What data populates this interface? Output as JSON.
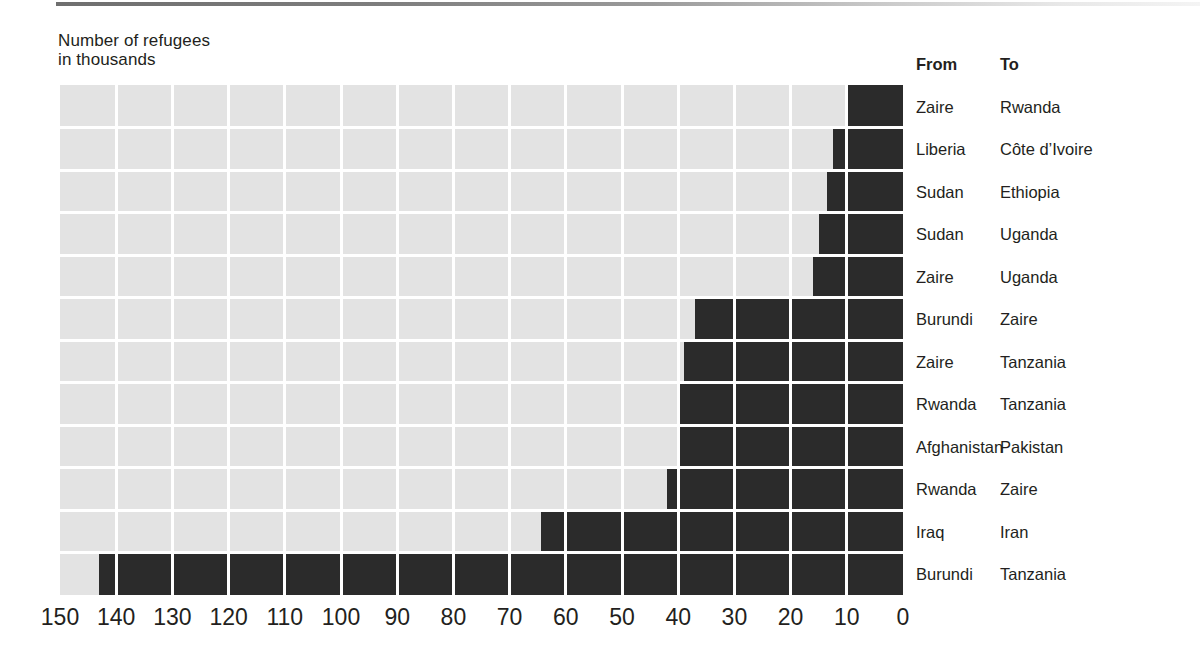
{
  "chart_data": {
    "type": "bar",
    "orientation": "horizontal",
    "title": "Number of refugees\nin thousands",
    "title_lines": [
      "Number of refugees",
      "in thousands"
    ],
    "xlabel": "",
    "ylabel": "",
    "xlim": [
      150,
      0
    ],
    "x_axis_reversed": true,
    "xticks": [
      150,
      140,
      130,
      120,
      110,
      100,
      90,
      80,
      70,
      60,
      50,
      40,
      30,
      20,
      10,
      0
    ],
    "xtick_labels": [
      "150",
      "140",
      "130",
      "120",
      "110",
      "100",
      "90",
      "80",
      "70",
      "60",
      "50",
      "40",
      "30",
      "20",
      "10",
      "0"
    ],
    "grid": true,
    "grid_color": "#ffffff",
    "plot_background": "#e3e3e3",
    "bar_color": "#2b2b2b",
    "legend": null,
    "units": "thousands",
    "columns": [
      "From",
      "To"
    ],
    "categories": [
      "Zaire → Rwanda",
      "Liberia → Côte d’Ivoire",
      "Sudan → Ethiopia",
      "Sudan → Uganda",
      "Zaire → Uganda",
      "Burundi → Zaire",
      "Zaire → Tanzania",
      "Rwanda → Tanzania",
      "Afghanistan → Pakistan",
      "Rwanda → Zaire",
      "Iraq → Iran",
      "Burundi → Tanzania"
    ],
    "values": [
      10,
      12.5,
      13.5,
      15,
      16,
      37,
      39,
      40,
      40,
      42,
      64.5,
      143
    ],
    "rows": [
      {
        "from": "Zaire",
        "to": "Rwanda",
        "value": 10
      },
      {
        "from": "Liberia",
        "to": "Côte d’Ivoire",
        "value": 12.5
      },
      {
        "from": "Sudan",
        "to": "Ethiopia",
        "value": 13.5
      },
      {
        "from": "Sudan",
        "to": "Uganda",
        "value": 15
      },
      {
        "from": "Zaire",
        "to": "Uganda",
        "value": 16
      },
      {
        "from": "Burundi",
        "to": "Zaire",
        "value": 37
      },
      {
        "from": "Zaire",
        "to": "Tanzania",
        "value": 39
      },
      {
        "from": "Rwanda",
        "to": "Tanzania",
        "value": 40
      },
      {
        "from": "Afghanistan",
        "to": "Pakistan",
        "value": 40
      },
      {
        "from": "Rwanda",
        "to": "Zaire",
        "value": 42
      },
      {
        "from": "Iraq",
        "to": "Iran",
        "value": 64.5
      },
      {
        "from": "Burundi",
        "to": "Tanzania",
        "value": 143
      }
    ]
  },
  "table": {
    "header_from": "From",
    "header_to": "To"
  }
}
